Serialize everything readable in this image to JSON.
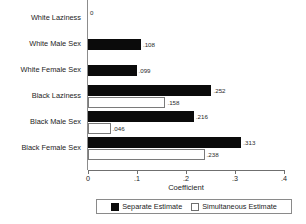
{
  "chart_data": {
    "type": "bar",
    "orientation": "horizontal",
    "title": "",
    "xlabel": "Coefficient",
    "ylabel": "",
    "xlim": [
      0,
      0.4
    ],
    "xticks": [
      0,
      0.1,
      0.2,
      0.3,
      0.4
    ],
    "xtick_labels": [
      "0",
      ".1",
      ".2",
      ".3",
      ".4"
    ],
    "grid": false,
    "legend_position": "bottom",
    "categories": [
      "White Laziness",
      "White Male Sex",
      "White Female Sex",
      "Black Laziness",
      "Black Male Sex",
      "Black Female Sex"
    ],
    "series": [
      {
        "name": "Separate Estimate",
        "color": "#0b0b0b",
        "values": [
          0,
          0.108,
          0.099,
          0.252,
          0.216,
          0.313
        ],
        "value_labels": [
          "0",
          ".108",
          ".099",
          ".252",
          ".216",
          ".313"
        ]
      },
      {
        "name": "Simultaneous Estimate",
        "color": "#ffffff",
        "values": [
          null,
          null,
          null,
          0.158,
          0.046,
          0.238
        ],
        "value_labels": [
          "",
          "",
          "",
          ".158",
          ".046",
          ".238"
        ]
      }
    ]
  },
  "legend": {
    "items": [
      {
        "label": "Separate Estimate"
      },
      {
        "label": "Simultaneous Estimate"
      }
    ]
  }
}
